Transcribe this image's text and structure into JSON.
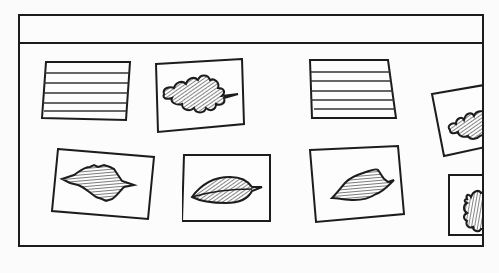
{
  "illustration": {
    "description": "Bulletin board frame with lined note cards and leaf pictures",
    "colors": {
      "ink": "#1c1c1c",
      "paper": "#fbfbfb"
    },
    "cards": [
      {
        "id": "card-1",
        "kind": "lined-notecard",
        "lines": 5
      },
      {
        "id": "card-2",
        "kind": "leaf-picture",
        "leaf": "oak-leaf"
      },
      {
        "id": "card-3",
        "kind": "lined-notecard",
        "lines": 5
      },
      {
        "id": "card-4",
        "kind": "leaf-picture",
        "leaf": "oak-leaf",
        "partially_hidden": true
      },
      {
        "id": "card-5",
        "kind": "leaf-picture",
        "leaf": "serrated-leaf"
      },
      {
        "id": "card-6",
        "kind": "leaf-picture",
        "leaf": "smooth-leaf"
      },
      {
        "id": "card-7",
        "kind": "leaf-picture",
        "leaf": "wavy-leaf"
      },
      {
        "id": "card-8",
        "kind": "leaf-picture",
        "leaf": "lobed-leaf",
        "partially_hidden": true
      }
    ]
  }
}
